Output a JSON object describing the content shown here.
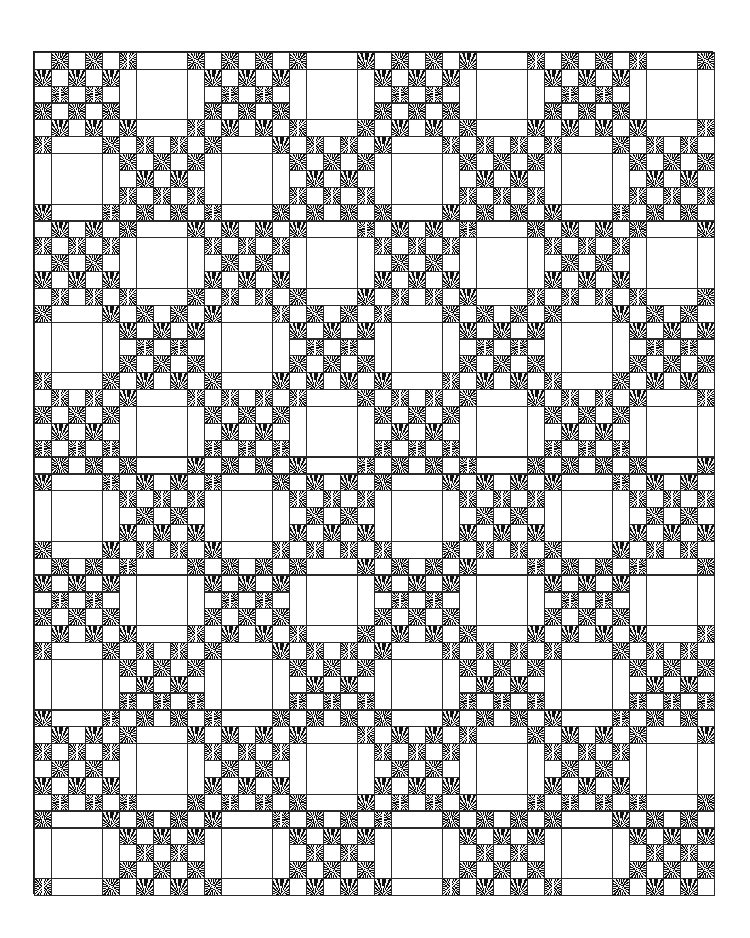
{
  "quilt": {
    "title": "Irish Chain quilt pattern",
    "block_rows": 10,
    "block_cols": 8,
    "units_per_block": 5,
    "origin_px": [
      33,
      51
    ],
    "size_px": [
      680,
      843
    ],
    "colors": {
      "line": "#2a2a2a",
      "background": "#ffffff",
      "print_dark": "#111111",
      "print_light": "#f4f4f4"
    },
    "block_types": {
      "nine_patch_rule": "block (row+col) even",
      "plain_rule": "block (row+col) odd"
    },
    "nine_patch": {
      "description": "5x5 checkerboard; dark print where (local_row+local_col) odd"
    },
    "plain_block": {
      "description": "1x1 dark print corners, 3x1 plain side strips, 3x3 plain center"
    }
  }
}
